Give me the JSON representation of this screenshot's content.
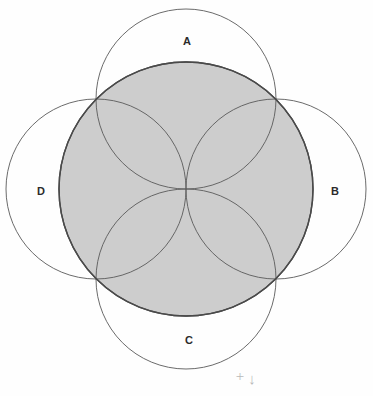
{
  "figure": {
    "background_color": "#fefefe",
    "canvas": {
      "width": 373,
      "height": 396
    }
  },
  "chart_data": {
    "type": "diagram",
    "subtype": "circle-overlap-rosette",
    "center": {
      "x": 186,
      "y": 189
    },
    "shaded_circle": {
      "name": "central-shaded-circle",
      "cx": 186,
      "cy": 189,
      "r": 127,
      "fill": "#cdcdcd",
      "stroke": "#4a4a4a",
      "stroke_width": 1.4,
      "filled": true
    },
    "petal_circles": [
      {
        "label": "A",
        "position": "top",
        "cx": 186,
        "cy": 99,
        "r": 90,
        "fill": "none",
        "stroke": "#5a5a5a",
        "stroke_width": 0.9,
        "label_x": 187,
        "label_y": 42
      },
      {
        "label": "B",
        "position": "right",
        "cx": 276,
        "cy": 189,
        "r": 90,
        "fill": "none",
        "stroke": "#5a5a5a",
        "stroke_width": 0.9,
        "label_x": 335,
        "label_y": 192
      },
      {
        "label": "C",
        "position": "bottom",
        "cx": 186,
        "cy": 279,
        "r": 90,
        "fill": "none",
        "stroke": "#5a5a5a",
        "stroke_width": 0.9,
        "label_x": 189,
        "label_y": 341
      },
      {
        "label": "D",
        "position": "left",
        "cx": 96,
        "cy": 189,
        "r": 90,
        "fill": "none",
        "stroke": "#5a5a5a",
        "stroke_width": 0.9,
        "label_x": 41,
        "label_y": 192
      }
    ],
    "labels": [
      "A",
      "B",
      "C",
      "D"
    ],
    "annotation": {
      "name": "pencil-mark",
      "text": "+",
      "arrow": "↓",
      "x": 240,
      "y": 378,
      "color": "#b9b9b9"
    },
    "grid": false,
    "legend": false
  },
  "colors": {
    "shade_fill": "#cdcdcd",
    "shade_stroke": "#4a4a4a",
    "outline_stroke": "#5a5a5a",
    "label_color": "#2b2b2b",
    "annotation_color": "#b9b9b9",
    "background": "#fefefe"
  }
}
